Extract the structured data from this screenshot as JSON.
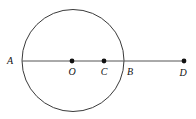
{
  "figure": {
    "kind": "geometry-diagram",
    "canvas": {
      "width": 196,
      "height": 119,
      "background": "#ffffff"
    },
    "style": {
      "stroke_color": "#3a3a3a",
      "line_color": "#555555",
      "dot_color": "#111111",
      "label_color": "#111111",
      "stroke_width": 1,
      "dot_radius": 2.4,
      "label_font_size": 10
    },
    "circle": {
      "name": "main-circle",
      "center_x": 73,
      "center_y": 60.5,
      "radius": 51
    },
    "line": {
      "name": "horizontal-line",
      "x1": 22,
      "y1": 61,
      "x2": 184,
      "y2": 61
    },
    "points": [
      {
        "id": "A",
        "label": "A",
        "x": 22,
        "y": 61,
        "dot": false,
        "label_x": 10,
        "label_y": 64
      },
      {
        "id": "O",
        "label": "O",
        "x": 72,
        "y": 61,
        "dot": true,
        "label_x": 72,
        "label_y": 75
      },
      {
        "id": "C",
        "label": "C",
        "x": 104,
        "y": 61,
        "dot": true,
        "label_x": 104,
        "label_y": 75
      },
      {
        "id": "B",
        "label": "B",
        "x": 124,
        "y": 61,
        "dot": false,
        "label_x": 130,
        "label_y": 75
      },
      {
        "id": "D",
        "label": "D",
        "x": 184,
        "y": 61,
        "dot": true,
        "label_x": 183,
        "label_y": 76
      }
    ]
  }
}
